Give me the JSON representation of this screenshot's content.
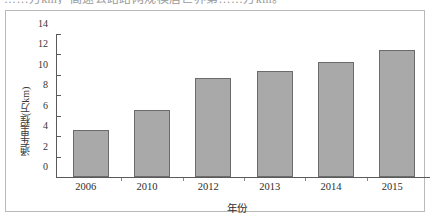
{
  "top_remnant": {
    "text": "……万km，高速公路路网规模居世界第……万km。"
  },
  "chart_data": {
    "type": "bar",
    "title": "",
    "subtitle": "",
    "xlabel": "年份",
    "ylabel": "通车里程(万km)",
    "categories": [
      "2006",
      "2010",
      "2012",
      "2013",
      "2014",
      "2015"
    ],
    "values": [
      4.6,
      6.6,
      9.7,
      10.4,
      11.25,
      12.4
    ],
    "series": [
      {
        "name": "通车里程",
        "values": [
          4.6,
          6.6,
          9.7,
          10.4,
          11.25,
          12.4
        ]
      }
    ],
    "ylim": [
      0,
      14
    ],
    "ytick_labels": [
      "0",
      "2",
      "4",
      "6",
      "8",
      "10",
      "12",
      "14"
    ],
    "ytick_values": [
      0,
      2,
      4,
      6,
      8,
      10,
      12,
      14
    ],
    "xtick_labels": [
      "2006",
      "2010",
      "2012",
      "2013",
      "2014",
      "2015"
    ],
    "grid": false,
    "legend": false,
    "legend_position": "none",
    "annotations": [],
    "colors": {
      "bar_fill": "#a9a9a9",
      "bar_border": "#6b6b6b",
      "axis": "#5a5a5a",
      "frame": "#b9b9b9",
      "text": "#2d2d2d",
      "background": "#ffffff"
    }
  }
}
